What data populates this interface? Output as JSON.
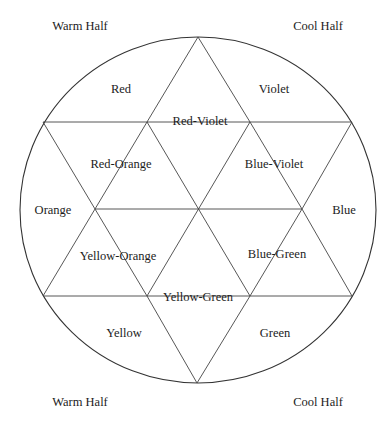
{
  "corners": {
    "top_left": "Warm Half",
    "top_right": "Cool Half",
    "bottom_left": "Warm Half",
    "bottom_right": "Cool Half"
  },
  "segments": {
    "red": "Red",
    "red_violet": "Red-Violet",
    "violet": "Violet",
    "red_orange": "Red-Orange",
    "blue_violet": "Blue-Violet",
    "orange": "Orange",
    "blue": "Blue",
    "yellow_orange": "Yellow-Orange",
    "blue_green": "Blue-Green",
    "yellow_green": "Yellow-Green",
    "yellow": "Yellow",
    "green": "Green"
  },
  "colors": {
    "line": "#333333",
    "background": "#ffffff"
  }
}
